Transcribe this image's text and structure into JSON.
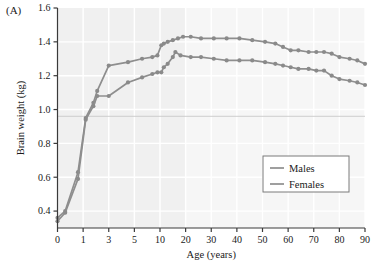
{
  "figure": {
    "panel_label": "(A)",
    "colors": {
      "series_line": "#8e8e8e",
      "marker": "#8a8a8a",
      "axis": "#3a3a3a",
      "plot_background": "#f0f0f0",
      "plot_background_right": "#f6f6f6",
      "gridline": "#ffffff",
      "reference_line": "#c9c9c9",
      "text": "#1a1a1a",
      "legend_border": "#7a7a7a",
      "legend_background": "#ffffff"
    }
  },
  "chart_data": {
    "type": "line",
    "title": "",
    "xlabel": "Age (years)",
    "ylabel": "Brain weight (kg)",
    "x_tick_labels": [
      "0",
      "1",
      "3",
      "5",
      "10",
      "20",
      "30",
      "40",
      "50",
      "60",
      "70",
      "80",
      "90"
    ],
    "x_tick_values": [
      0,
      1,
      3,
      5,
      10,
      20,
      30,
      40,
      50,
      60,
      70,
      80,
      90
    ],
    "y_tick_labels": [
      "0.4",
      "0.6",
      "0.8",
      "1.0",
      "1.2",
      "1.4",
      "1.6"
    ],
    "y_tick_values": [
      0.4,
      0.6,
      0.8,
      1.0,
      1.2,
      1.4,
      1.6
    ],
    "ylim": [
      0.3,
      1.6
    ],
    "grid": true,
    "legend_position": "lower-right",
    "reference_line_y": 0.96,
    "series": [
      {
        "name": "Males",
        "x": [
          0,
          0.3,
          0.8,
          1.2,
          1.8,
          2.1,
          3.0,
          4.5,
          6.5,
          8.5,
          9.5,
          10.5,
          11.5,
          13.0,
          15.0,
          17.0,
          19.0,
          22.0,
          26.0,
          31.0,
          36.0,
          41.0,
          46.0,
          51.0,
          55.0,
          58.0,
          61.0,
          64.0,
          68.0,
          71.0,
          74.0,
          77.0,
          80.0,
          84.0,
          87.0,
          90.0
        ],
        "values": [
          0.36,
          0.4,
          0.63,
          0.95,
          1.04,
          1.11,
          1.26,
          1.28,
          1.3,
          1.31,
          1.32,
          1.38,
          1.39,
          1.4,
          1.41,
          1.42,
          1.43,
          1.43,
          1.42,
          1.42,
          1.42,
          1.42,
          1.41,
          1.4,
          1.39,
          1.37,
          1.35,
          1.35,
          1.34,
          1.34,
          1.34,
          1.33,
          1.31,
          1.3,
          1.29,
          1.27
        ]
      },
      {
        "name": "Females",
        "x": [
          0,
          0.3,
          0.8,
          1.2,
          1.8,
          2.1,
          3.0,
          4.5,
          6.5,
          8.5,
          9.5,
          10.5,
          11.5,
          13.0,
          15.0,
          16.0,
          18.0,
          22.0,
          26.0,
          31.0,
          36.0,
          41.0,
          46.0,
          51.0,
          55.0,
          58.0,
          61.0,
          64.0,
          68.0,
          71.0,
          74.0,
          77.0,
          80.0,
          84.0,
          87.0,
          90.0
        ],
        "values": [
          0.34,
          0.39,
          0.59,
          0.94,
          1.02,
          1.08,
          1.08,
          1.16,
          1.19,
          1.21,
          1.22,
          1.22,
          1.25,
          1.27,
          1.31,
          1.34,
          1.32,
          1.31,
          1.31,
          1.3,
          1.29,
          1.29,
          1.29,
          1.28,
          1.27,
          1.26,
          1.25,
          1.24,
          1.24,
          1.23,
          1.23,
          1.2,
          1.18,
          1.17,
          1.16,
          1.145
        ]
      }
    ]
  },
  "legend": {
    "entries": [
      {
        "label": "Males"
      },
      {
        "label": "Females"
      }
    ]
  }
}
